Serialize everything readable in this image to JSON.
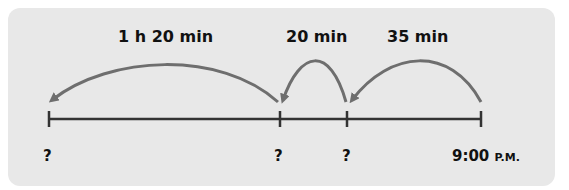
{
  "diagram": {
    "type": "number-line-elapsed-time",
    "jumps": [
      {
        "label": "1 h 20 min",
        "from": "?",
        "to": "?"
      },
      {
        "label": "20 min",
        "from": "?",
        "to": "?"
      },
      {
        "label": "35 min",
        "from": "9:00 P.M.",
        "to": "?"
      }
    ],
    "ticks": [
      {
        "label": "?"
      },
      {
        "label": "?"
      },
      {
        "label": "?"
      },
      {
        "time": "9:00",
        "suffix": "P.M."
      }
    ],
    "colors": {
      "panel": "#e8e8e8",
      "line": "#333333",
      "arrow": "#6e6e6e",
      "text": "#111111"
    }
  }
}
